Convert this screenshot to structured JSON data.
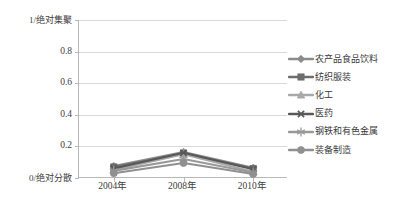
{
  "chart_data": {
    "type": "line",
    "title": "",
    "subtitle": "",
    "xlabel": "",
    "ylabel": "1/绝对集聚",
    "categories": [
      "2004年",
      "2008年",
      "2010年"
    ],
    "ytick_labels": [
      "1/绝对集聚",
      "0.8",
      "0.6",
      "0.4",
      "0.2",
      "0/绝对分散"
    ],
    "ytick_values": [
      1,
      0.8,
      0.6,
      0.4,
      0.2,
      0
    ],
    "ylim": [
      0,
      1
    ],
    "grid": true,
    "legend_position": "right",
    "axis_top_label": "1/绝对集聚",
    "axis_bottom_label": "0/绝对分散",
    "series": [
      {
        "name": "农产品食品饮料",
        "marker": "diamond",
        "color": "#8c8c8c",
        "values": [
          0.075,
          0.165,
          0.065
        ]
      },
      {
        "name": "纺织服装",
        "marker": "square",
        "color": "#6e6e6e",
        "values": [
          0.07,
          0.155,
          0.06
        ]
      },
      {
        "name": "化工",
        "marker": "triangle",
        "color": "#a8a8a8",
        "values": [
          0.05,
          0.15,
          0.04
        ]
      },
      {
        "name": "医药",
        "marker": "x",
        "color": "#585858",
        "values": [
          0.06,
          0.16,
          0.055
        ]
      },
      {
        "name": "钢铁和有色金属",
        "marker": "asterisk",
        "color": "#999999",
        "values": [
          0.045,
          0.12,
          0.035
        ]
      },
      {
        "name": "装备制造",
        "marker": "circle",
        "color": "#909090",
        "values": [
          0.03,
          0.095,
          0.025
        ]
      }
    ]
  },
  "legend": {
    "items": [
      {
        "label": "农产品食品饮料"
      },
      {
        "label": "纺织服装"
      },
      {
        "label": "化工"
      },
      {
        "label": "医药"
      },
      {
        "label": "钢铁和有色金属"
      },
      {
        "label": "装备制造"
      }
    ]
  },
  "axis": {
    "y": {
      "t0": "1/绝对集聚",
      "t1": "0.8",
      "t2": "0.6",
      "t3": "0.4",
      "t4": "0.2",
      "t5": "0/绝对分散"
    },
    "x": {
      "t0": "2004年",
      "t1": "2008年",
      "t2": "2010年"
    }
  }
}
